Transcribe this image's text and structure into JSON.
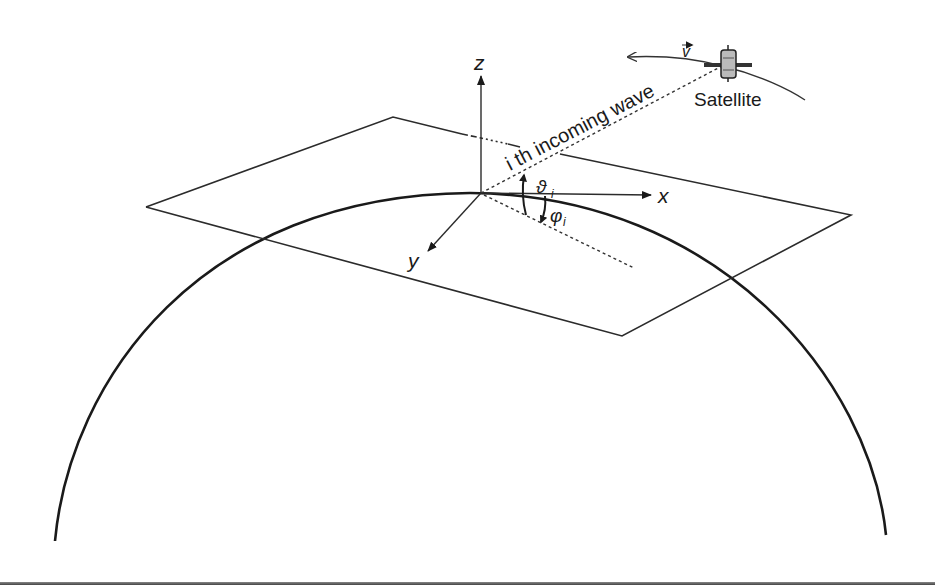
{
  "diagram": {
    "labels": {
      "z_axis": "z",
      "x_axis": "x",
      "y_axis": "y",
      "wave_label": "i th incoming wave",
      "elevation_angle": "ϑ",
      "elevation_sub": "i",
      "azimuth_angle": "φ",
      "azimuth_sub": "i",
      "satellite": "Satellite",
      "velocity": "v"
    },
    "colors": {
      "line": "#2b2b2b",
      "earth": "#1a1a1a",
      "background": "#ffffff"
    },
    "elements": [
      {
        "type": "earth-arc",
        "description": "Earth surface curvature"
      },
      {
        "type": "tangent-plane",
        "description": "Local horizontal plane"
      },
      {
        "type": "axes",
        "names": [
          "x",
          "y",
          "z"
        ]
      },
      {
        "type": "satellite",
        "label": "Satellite",
        "velocity_vector": "v"
      },
      {
        "type": "incoming-wave",
        "label": "i th incoming wave",
        "style": "dashed"
      },
      {
        "type": "angle",
        "symbol": "ϑ_i",
        "meaning": "elevation"
      },
      {
        "type": "angle",
        "symbol": "φ_i",
        "meaning": "azimuth"
      }
    ]
  }
}
